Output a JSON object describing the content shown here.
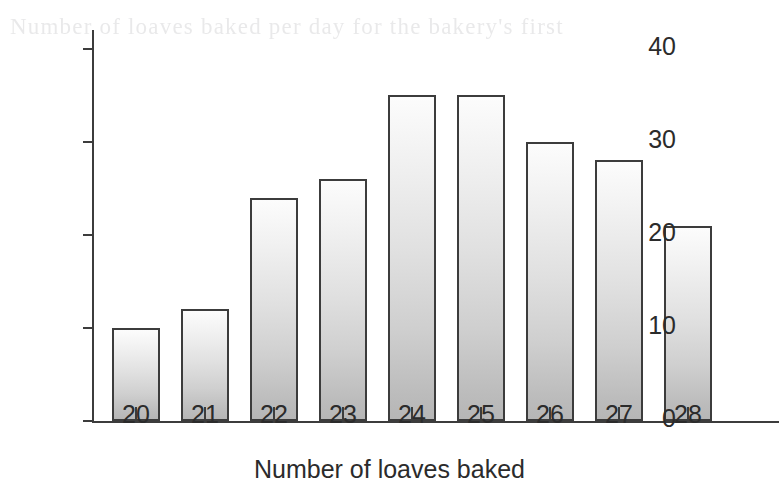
{
  "artifacts": {
    "ghost_text": "Number of loaves baked per day for the bakery's first"
  },
  "chart_data": {
    "type": "bar",
    "title": "",
    "subtitle": "",
    "xlabel": "Number of loaves baked",
    "ylabel": "Frequency",
    "categories": [
      "20",
      "21",
      "22",
      "23",
      "24",
      "25",
      "26",
      "27",
      "28"
    ],
    "values": [
      10,
      12,
      24,
      26,
      35,
      35,
      30,
      28,
      21
    ],
    "series": [
      {
        "name": "Frequency",
        "values": [
          10,
          12,
          24,
          26,
          35,
          35,
          30,
          28,
          21
        ]
      }
    ],
    "ylim": [
      0,
      42
    ],
    "ytick_labels": [
      "0",
      "10",
      "20",
      "30",
      "40"
    ],
    "ytick_values": [
      0,
      10,
      20,
      30,
      40
    ],
    "xtick_labels": [
      "20",
      "21",
      "22",
      "23",
      "24",
      "25",
      "26",
      "27",
      "28"
    ],
    "grid": false,
    "legend": null,
    "annotations": [],
    "colors": {
      "axis": "#3c3c3c",
      "bar_outline": "#3c3c3c",
      "bar_fill_top": "#fcfcfc",
      "bar_fill_bottom": "#b6b6b6",
      "text": "#2b2b2b",
      "background": "#ffffff"
    }
  }
}
